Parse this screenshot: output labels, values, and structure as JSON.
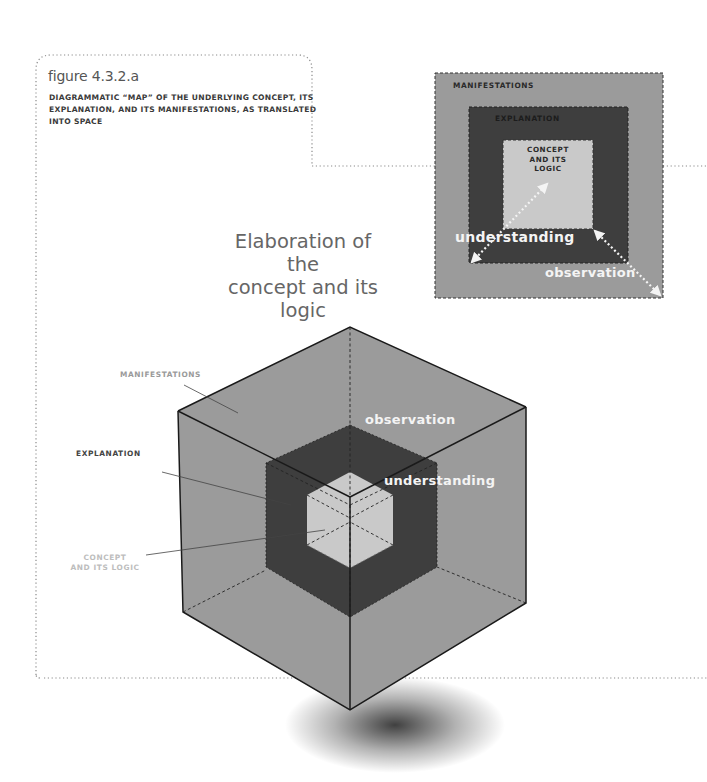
{
  "figure": {
    "number": "figure 4.3.2.a",
    "caption": "DIAGRAMMATIC “MAP” OF THE UNDERLYING CONCEPT, ITS EXPLANATION, AND ITS MANIFESTATIONS, AS TRANSLATED INTO SPACE"
  },
  "heading": {
    "line1": "Elaboration of the",
    "line2": "concept and its",
    "line3": "logic"
  },
  "cube": {
    "labels": {
      "manifestations": "MANIFESTATIONS",
      "explanation": "EXPLANATION",
      "concept_line1": "CONCEPT",
      "concept_line2": "AND ITS LOGIC"
    },
    "arrows": {
      "observation": "observation",
      "understanding": "understanding"
    }
  },
  "nested_box": {
    "outer_label": "MANIFESTATIONS",
    "middle_label": "EXPLANATION",
    "inner_label_line1": "CONCEPT",
    "inner_label_line2": "AND ITS",
    "inner_label_line3": "LOGIC",
    "arrow_understanding": "understanding",
    "arrow_observation": "observation"
  },
  "colors": {
    "outer": "#9b9b9b",
    "middle": "#3e3e3e",
    "inner": "#c9c9c9",
    "frame": "#8a8a8a",
    "edge": "#1a1a1a"
  }
}
